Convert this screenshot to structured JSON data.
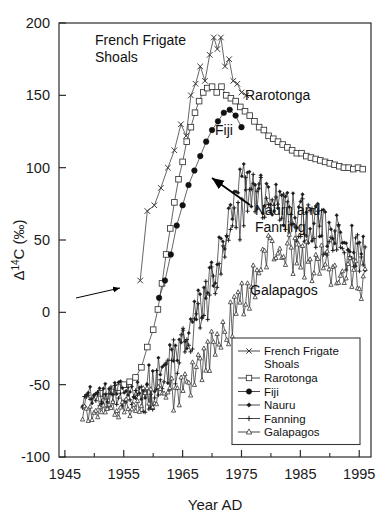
{
  "chart_data": {
    "type": "line",
    "title": "",
    "xlabel": "Year AD",
    "ylabel": "Δ14C (‰)",
    "ylabel_parts": {
      "delta": "Δ",
      "sup": "14",
      "rest": "C (‰)"
    },
    "xlim": [
      1944,
      1997
    ],
    "ylim": [
      -100,
      200
    ],
    "xticks": [
      1945,
      1955,
      1965,
      1975,
      1985,
      1995
    ],
    "xticklabels": [
      "1945",
      "1955",
      "1965",
      "1975",
      "1985",
      "1995"
    ],
    "xminorticks": [
      1950,
      1960,
      1970,
      1980,
      1990
    ],
    "yticks": [
      -100,
      -50,
      0,
      50,
      100,
      150,
      200
    ],
    "yticklabels": [
      "-100",
      "-50",
      "0",
      "50",
      "100",
      "150",
      "200"
    ],
    "grid": false,
    "legend_position": "bottom-right",
    "series": [
      {
        "name": "French Frigate Shoals",
        "marker": "x",
        "color": "#333333",
        "points": [
          [
            1957.8,
            22
          ],
          [
            1959.0,
            70
          ],
          [
            1960.2,
            74
          ],
          [
            1961.3,
            86
          ],
          [
            1962.5,
            100
          ],
          [
            1963.6,
            112
          ],
          [
            1964.7,
            130
          ],
          [
            1965.6,
            122
          ],
          [
            1966.4,
            150
          ],
          [
            1967.2,
            158
          ],
          [
            1968.0,
            170
          ],
          [
            1968.8,
            160
          ],
          [
            1969.6,
            178
          ],
          [
            1970.3,
            190
          ],
          [
            1970.9,
            182
          ],
          [
            1971.5,
            190
          ],
          [
            1972.2,
            170
          ],
          [
            1972.9,
            175
          ],
          [
            1973.6,
            160
          ],
          [
            1974.3,
            158
          ],
          [
            1975.0,
            152
          ],
          [
            1975.8,
            150
          ]
        ]
      },
      {
        "name": "Rarotonga",
        "marker": "square-open",
        "color": "#333333",
        "points": [
          [
            1951.0,
            -56
          ],
          [
            1952.0,
            -58
          ],
          [
            1953.0,
            -55
          ],
          [
            1954.0,
            -52
          ],
          [
            1955.0,
            -50
          ],
          [
            1956.0,
            -48
          ],
          [
            1957.0,
            -45
          ],
          [
            1958.0,
            -38
          ],
          [
            1959.0,
            -24
          ],
          [
            1960.0,
            -12
          ],
          [
            1960.8,
            2
          ],
          [
            1961.5,
            20
          ],
          [
            1962.2,
            40
          ],
          [
            1962.9,
            58
          ],
          [
            1963.6,
            76
          ],
          [
            1964.3,
            92
          ],
          [
            1965.0,
            104
          ],
          [
            1965.7,
            118
          ],
          [
            1966.4,
            128
          ],
          [
            1967.1,
            138
          ],
          [
            1967.8,
            146
          ],
          [
            1968.5,
            152
          ],
          [
            1969.2,
            155
          ],
          [
            1970.0,
            156
          ],
          [
            1970.8,
            152
          ],
          [
            1971.6,
            156
          ],
          [
            1972.4,
            150
          ],
          [
            1973.2,
            148
          ],
          [
            1974.0,
            146
          ],
          [
            1974.8,
            142
          ],
          [
            1975.6,
            139
          ],
          [
            1976.4,
            136
          ],
          [
            1977.2,
            132
          ],
          [
            1978.0,
            128
          ],
          [
            1978.8,
            126
          ],
          [
            1979.6,
            122
          ],
          [
            1980.4,
            120
          ],
          [
            1981.2,
            118
          ],
          [
            1982.0,
            116
          ],
          [
            1982.8,
            114
          ],
          [
            1983.6,
            112
          ],
          [
            1984.4,
            110
          ],
          [
            1985.2,
            110
          ],
          [
            1986.0,
            108
          ],
          [
            1986.8,
            107
          ],
          [
            1987.6,
            106
          ],
          [
            1988.4,
            105
          ],
          [
            1989.2,
            104
          ],
          [
            1990.0,
            103
          ],
          [
            1990.8,
            102
          ],
          [
            1991.6,
            101
          ],
          [
            1992.4,
            100
          ],
          [
            1993.2,
            100
          ],
          [
            1994.0,
            99
          ],
          [
            1994.8,
            100
          ],
          [
            1995.6,
            99
          ]
        ]
      },
      {
        "name": "Fiji",
        "marker": "circle-filled",
        "color": "#111111",
        "points": [
          [
            1961.0,
            10
          ],
          [
            1962.0,
            22
          ],
          [
            1963.0,
            40
          ],
          [
            1964.0,
            60
          ],
          [
            1965.0,
            74
          ],
          [
            1966.0,
            88
          ],
          [
            1967.0,
            98
          ],
          [
            1968.0,
            108
          ],
          [
            1969.0,
            118
          ],
          [
            1970.0,
            126
          ],
          [
            1971.0,
            132
          ],
          [
            1972.0,
            138
          ],
          [
            1973.0,
            140
          ],
          [
            1974.0,
            136
          ],
          [
            1975.0,
            128
          ]
        ]
      },
      {
        "name": "Nauru",
        "marker": "dot-filled",
        "color": "#1a1a1a",
        "band": {
          "start": 1948,
          "end": 1996,
          "baseline": -58,
          "peak_year": 1975,
          "peak": 90,
          "noise": 16
        }
      },
      {
        "name": "Fanning",
        "marker": "plus",
        "color": "#1a1a1a",
        "band": {
          "start": 1948,
          "end": 1996,
          "baseline": -60,
          "peak_year": 1976,
          "peak": 84,
          "noise": 18
        }
      },
      {
        "name": "Galapagos",
        "marker": "triangle-open",
        "color": "#333333",
        "band": {
          "start": 1948,
          "end": 1996,
          "baseline": -70,
          "peak_year": 1980,
          "peak": 46,
          "noise": 14
        }
      }
    ],
    "annotations": [
      {
        "name": "french-frigate-shoals",
        "text_lines": [
          "French Frigate",
          "Shoals"
        ],
        "x": 95,
        "y": 45,
        "arrow": {
          "x1": 76,
          "y1": 298,
          "x2": 120,
          "y2": 288
        }
      },
      {
        "name": "rarotonga",
        "text_lines": [
          "Rarotonga"
        ],
        "x": 245,
        "y": 100
      },
      {
        "name": "fiji",
        "text_lines": [
          "Fiji"
        ],
        "x": 215,
        "y": 135
      },
      {
        "name": "nauru-and-fanning",
        "text_lines": [
          "Nauru and",
          "Fanning"
        ],
        "x": 255,
        "y": 215,
        "arrow": {
          "x1": 250,
          "y1": 205,
          "x2": 212,
          "y2": 178
        }
      },
      {
        "name": "galapagos",
        "text_lines": [
          "Galapagos"
        ],
        "x": 250,
        "y": 295
      }
    ],
    "legend_entries": [
      {
        "label_lines": [
          "French Frigate",
          "Shoals"
        ],
        "marker": "x"
      },
      {
        "label_lines": [
          "Rarotonga"
        ],
        "marker": "square-open"
      },
      {
        "label_lines": [
          "Fiji"
        ],
        "marker": "circle-filled"
      },
      {
        "label_lines": [
          "Nauru"
        ],
        "marker": "dot-filled"
      },
      {
        "label_lines": [
          "Fanning"
        ],
        "marker": "plus"
      },
      {
        "label_lines": [
          "Galapagos"
        ],
        "marker": "triangle-open"
      }
    ]
  }
}
